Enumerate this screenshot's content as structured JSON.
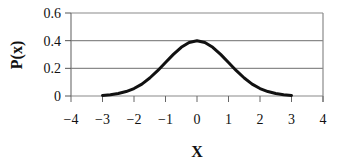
{
  "chart_data": {
    "type": "line",
    "title": "",
    "xlabel": "X",
    "ylabel": "P(x)",
    "xlim": [
      -4,
      4
    ],
    "ylim": [
      0,
      0.6
    ],
    "x_ticks": [
      "−4",
      "−3",
      "−2",
      "−1",
      "0",
      "1",
      "2",
      "3",
      "4"
    ],
    "y_ticks": [
      "0",
      "0.2",
      "0.4",
      "0.6"
    ],
    "grid": "horizontal",
    "legend": null,
    "series": [
      {
        "name": "P(x)",
        "color": "#111111",
        "x": [
          -3,
          -2.75,
          -2.5,
          -2.25,
          -2,
          -1.75,
          -1.5,
          -1.25,
          -1,
          -0.75,
          -0.5,
          -0.25,
          0,
          0.25,
          0.5,
          0.75,
          1,
          1.25,
          1.5,
          1.75,
          2,
          2.25,
          2.5,
          2.75,
          3
        ],
        "values": [
          0.004,
          0.009,
          0.018,
          0.032,
          0.054,
          0.086,
          0.13,
          0.183,
          0.242,
          0.301,
          0.352,
          0.387,
          0.399,
          0.387,
          0.352,
          0.301,
          0.242,
          0.183,
          0.13,
          0.086,
          0.054,
          0.032,
          0.018,
          0.009,
          0.004
        ]
      }
    ]
  }
}
